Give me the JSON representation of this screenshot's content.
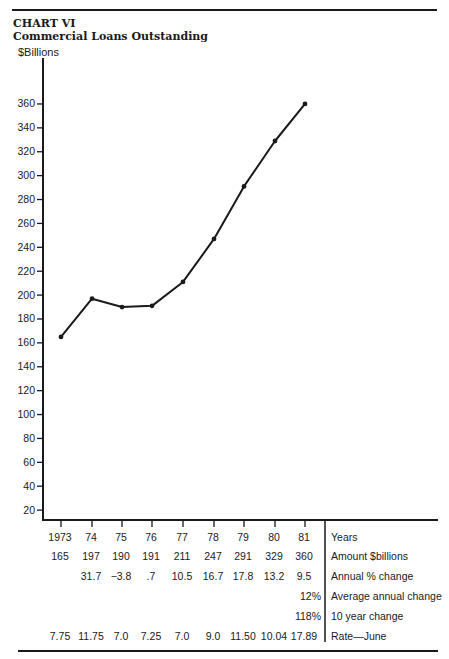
{
  "header": {
    "chart_number": "CHART VI",
    "title": "Commercial Loans Outstanding"
  },
  "chart_data": {
    "type": "line",
    "title": "Commercial Loans Outstanding",
    "subtitle": "CHART VI",
    "xlabel": "Years",
    "ylabel": "$Billions",
    "categories": [
      "1973",
      "74",
      "75",
      "76",
      "77",
      "78",
      "79",
      "80",
      "81"
    ],
    "series": [
      {
        "name": "Amount $billions",
        "values": [
          165,
          197,
          190,
          191,
          211,
          247,
          291,
          329,
          360
        ]
      }
    ],
    "y_ticks": [
      20,
      40,
      60,
      80,
      100,
      120,
      140,
      160,
      180,
      200,
      220,
      240,
      260,
      280,
      300,
      320,
      340,
      360
    ],
    "ylim": [
      0,
      370
    ],
    "grid": false,
    "legend": "none",
    "table": {
      "row_labels": [
        "Years",
        "Amount $billions",
        "Annual % change",
        "Average annual change",
        "10 year change",
        "Rate—June"
      ],
      "years": [
        "1973",
        "74",
        "75",
        "76",
        "77",
        "78",
        "79",
        "80",
        "81"
      ],
      "amount": [
        "165",
        "197",
        "190",
        "191",
        "211",
        "247",
        "291",
        "329",
        "360"
      ],
      "annual_pct_change": [
        "",
        "31.7",
        "−3.8",
        ".7",
        "10.5",
        "16.7",
        "17.8",
        "13.2",
        "9.5"
      ],
      "average_annual_change": "12%",
      "ten_year_change": "118%",
      "rate_june": [
        "7.75",
        "11.75",
        "7.0",
        "7.25",
        "7.0",
        "9.0",
        "11.50",
        "10.04",
        "17.89"
      ]
    }
  }
}
